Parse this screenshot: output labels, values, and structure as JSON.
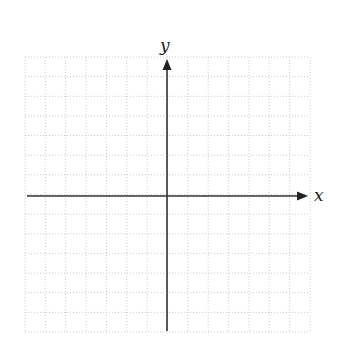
{
  "diagram": {
    "type": "coordinate-plane",
    "x_axis_label": "x",
    "y_axis_label": "y",
    "grid": {
      "style": "dotted",
      "columns": 14,
      "rows": 14,
      "left": 25,
      "top": 57,
      "right": 310,
      "bottom": 332,
      "color": "#bdbdbd"
    },
    "origin": {
      "x": 167,
      "y": 196
    },
    "axis_color": "#333333"
  }
}
